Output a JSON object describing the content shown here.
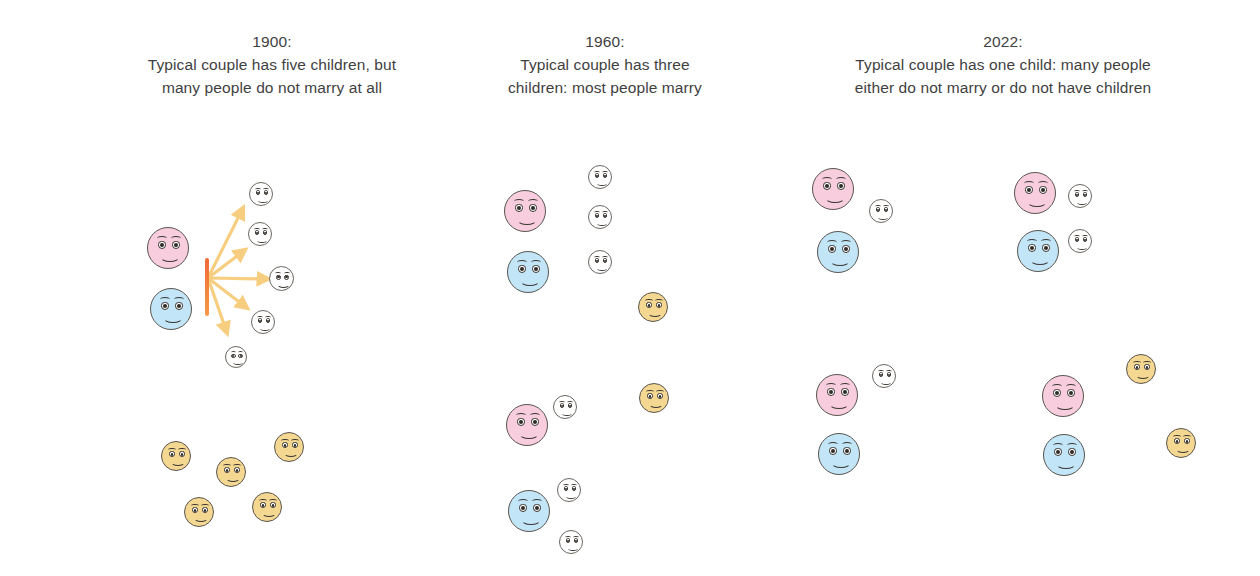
{
  "figure": {
    "background": "#ffffff",
    "text_color": "#3f3f3f",
    "colors": {
      "pink": "#f8cedf",
      "blue": "#c2e6f7",
      "yellow": "#f4d892",
      "white": "#ffffff",
      "outline": "#5a5550",
      "arrow": "#f7ce80",
      "bar_top": "#ef6a3c",
      "bar_bottom": "#f59a46"
    }
  },
  "panels": [
    {
      "id": "panel-1900",
      "year": "1900:",
      "caption_line_1": "Typical couple has five children, but",
      "caption_line_2": "many people do not marry at all",
      "header_center_x": 272,
      "groups": [
        {
          "name": "married-couple-with-five-children",
          "parents": [
            {
              "color": "pink",
              "x": 147,
              "y": 227,
              "size": 42
            },
            {
              "color": "blue",
              "x": 150,
              "y": 288,
              "size": 42
            }
          ],
          "children": [
            {
              "color": "white",
              "x": 249,
              "y": 182,
              "size": 24
            },
            {
              "color": "white",
              "x": 248,
              "y": 222,
              "size": 24
            },
            {
              "color": "white",
              "x": 269,
              "y": 266,
              "size": 25
            },
            {
              "color": "white",
              "x": 251,
              "y": 310,
              "size": 24
            },
            {
              "color": "white",
              "x": 225,
              "y": 346,
              "size": 22
            }
          ],
          "bar": {
            "x": 205,
            "y": 258,
            "height": 58
          },
          "arrow_origin": {
            "x": 208,
            "y": 278
          },
          "arrows": [
            {
              "x": 243,
              "y": 208
            },
            {
              "x": 245,
              "y": 250
            },
            {
              "x": 268,
              "y": 279
            },
            {
              "x": 247,
              "y": 308
            },
            {
              "x": 227,
              "y": 333
            }
          ]
        },
        {
          "name": "unmarried-single-people",
          "singles": [
            {
              "color": "yellow",
              "x": 161,
              "y": 441,
              "size": 30
            },
            {
              "color": "yellow",
              "x": 274,
              "y": 432,
              "size": 30
            },
            {
              "color": "yellow",
              "x": 216,
              "y": 457,
              "size": 30
            },
            {
              "color": "yellow",
              "x": 184,
              "y": 497,
              "size": 30
            },
            {
              "color": "yellow",
              "x": 252,
              "y": 492,
              "size": 30
            }
          ]
        }
      ]
    },
    {
      "id": "panel-1960",
      "year": "1960:",
      "caption_line_1": "Typical couple has three",
      "caption_line_2": "children: most people marry",
      "header_center_x": 605,
      "groups": [
        {
          "name": "married-couple-with-three-children-top",
          "parents": [
            {
              "color": "pink",
              "x": 504,
              "y": 190,
              "size": 42
            },
            {
              "color": "blue",
              "x": 507,
              "y": 251,
              "size": 42
            }
          ],
          "children": [
            {
              "color": "white",
              "x": 588,
              "y": 165,
              "size": 24
            },
            {
              "color": "white",
              "x": 588,
              "y": 205,
              "size": 24
            },
            {
              "color": "white",
              "x": 588,
              "y": 250,
              "size": 24
            }
          ]
        },
        {
          "name": "single-person-top",
          "singles": [
            {
              "color": "yellow",
              "x": 638,
              "y": 292,
              "size": 30
            }
          ]
        },
        {
          "name": "married-couple-with-three-children-bottom",
          "parents": [
            {
              "color": "pink",
              "x": 506,
              "y": 404,
              "size": 42
            },
            {
              "color": "blue",
              "x": 508,
              "y": 490,
              "size": 42
            }
          ],
          "children": [
            {
              "color": "white",
              "x": 553,
              "y": 395,
              "size": 24
            },
            {
              "color": "white",
              "x": 557,
              "y": 478,
              "size": 24
            },
            {
              "color": "white",
              "x": 559,
              "y": 530,
              "size": 24
            }
          ]
        },
        {
          "name": "single-person-bottom",
          "singles": [
            {
              "color": "yellow",
              "x": 639,
              "y": 383,
              "size": 30
            }
          ]
        }
      ]
    },
    {
      "id": "panel-2022",
      "year": "2022:",
      "caption_line_1": "Typical couple has one child: many people",
      "caption_line_2": "either do not marry or do not have children",
      "header_center_x": 1003,
      "groups": [
        {
          "name": "couple-with-one-child-top-left",
          "parents": [
            {
              "color": "pink",
              "x": 812,
              "y": 168,
              "size": 42
            },
            {
              "color": "blue",
              "x": 817,
              "y": 231,
              "size": 42
            }
          ],
          "children": [
            {
              "color": "white",
              "x": 869,
              "y": 199,
              "size": 24
            }
          ]
        },
        {
          "name": "couple-with-two-children-top-right",
          "parents": [
            {
              "color": "pink",
              "x": 1014,
              "y": 172,
              "size": 42
            },
            {
              "color": "blue",
              "x": 1017,
              "y": 230,
              "size": 42
            }
          ],
          "children": [
            {
              "color": "white",
              "x": 1068,
              "y": 184,
              "size": 24
            },
            {
              "color": "white",
              "x": 1068,
              "y": 229,
              "size": 24
            }
          ]
        },
        {
          "name": "couple-with-one-child-bottom-left",
          "parents": [
            {
              "color": "pink",
              "x": 816,
              "y": 374,
              "size": 42
            },
            {
              "color": "blue",
              "x": 818,
              "y": 433,
              "size": 42
            }
          ],
          "children": [
            {
              "color": "white",
              "x": 872,
              "y": 364,
              "size": 24
            }
          ]
        },
        {
          "name": "couple-without-children-bottom-right",
          "parents": [
            {
              "color": "pink",
              "x": 1042,
              "y": 375,
              "size": 42
            },
            {
              "color": "blue",
              "x": 1043,
              "y": 434,
              "size": 42
            }
          ],
          "children": []
        },
        {
          "name": "single-people-bottom-right",
          "singles": [
            {
              "color": "yellow",
              "x": 1126,
              "y": 354,
              "size": 30
            },
            {
              "color": "yellow",
              "x": 1166,
              "y": 428,
              "size": 30
            }
          ]
        }
      ]
    }
  ]
}
